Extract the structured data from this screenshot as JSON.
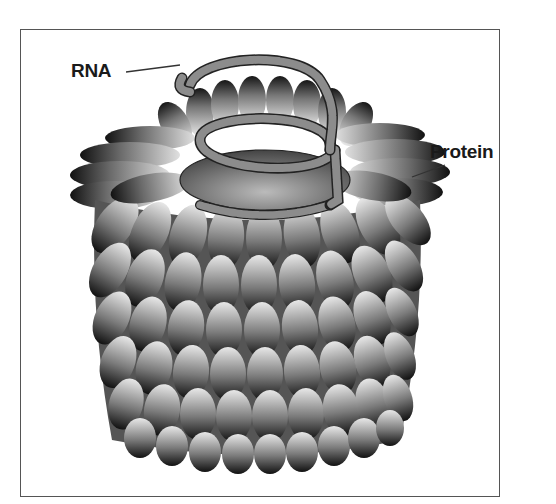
{
  "figure": {
    "labels": {
      "rna": "RNA",
      "protein": "Protein"
    },
    "colors": {
      "frame_border": "#555555",
      "subunit_dark": "#1a1a1a",
      "subunit_light": "#e6e6e6",
      "rna_fill": "#8c8c8c",
      "rna_stroke": "#222222",
      "label_text": "#1a1a1a"
    }
  }
}
